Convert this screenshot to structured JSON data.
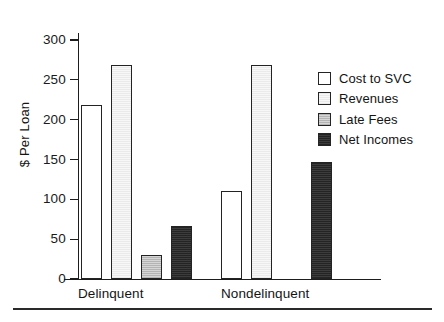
{
  "page": {
    "top_cropped_text": "___  ____  ___   ____    __"
  },
  "chart_data": {
    "type": "bar",
    "title": "",
    "xlabel": "",
    "ylabel": "$ Per Loan",
    "ylim": [
      0,
      300
    ],
    "yticks": [
      0,
      50,
      100,
      150,
      200,
      250,
      300
    ],
    "ytick_labels": [
      "0",
      "50",
      "100",
      "150",
      "200",
      "250",
      "300"
    ],
    "grid": false,
    "legend_position": "right",
    "categories": [
      "Delinquent",
      "Nondelinquent"
    ],
    "series": [
      {
        "name": "Cost to SVC",
        "values": [
          219,
          111
        ],
        "swatch": "white"
      },
      {
        "name": "Revenues",
        "values": [
          268,
          268
        ],
        "swatch": "light"
      },
      {
        "name": "Late Fees",
        "values": [
          30,
          0
        ],
        "swatch": "mid"
      },
      {
        "name": "Net Incomes",
        "values": [
          66,
          147
        ],
        "swatch": "dark"
      }
    ],
    "colors": {
      "cost_to_svc": "#ffffff",
      "revenues": "#f1f1f1",
      "late_fees": "#c4c4c4",
      "net_incomes": "#303030",
      "axis": "#1d1d1d",
      "text": "#141414"
    }
  }
}
